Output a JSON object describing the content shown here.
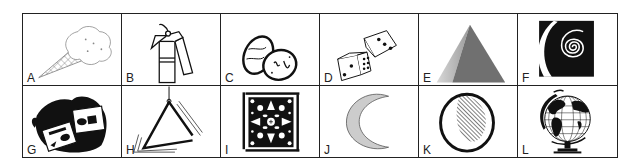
{
  "grid": {
    "rows": 2,
    "columns": 6,
    "cells": [
      {
        "label": "A",
        "icon": "ice-cream-cone-icon"
      },
      {
        "label": "B",
        "icon": "fire-extinguisher-icon"
      },
      {
        "label": "C",
        "icon": "easter-eggs-icon"
      },
      {
        "label": "D",
        "icon": "dice-icon"
      },
      {
        "label": "E",
        "icon": "pyramid-icon"
      },
      {
        "label": "F",
        "icon": "spiral-icon"
      },
      {
        "label": "G",
        "icon": "cassette-tapes-icon"
      },
      {
        "label": "H",
        "icon": "triangle-instrument-icon"
      },
      {
        "label": "I",
        "icon": "ornamental-tile-icon"
      },
      {
        "label": "J",
        "icon": "crescent-moon-icon"
      },
      {
        "label": "K",
        "icon": "moon-phase-icon"
      },
      {
        "label": "L",
        "icon": "globe-icon"
      }
    ]
  },
  "colors": {
    "border": "#222222",
    "ink": "#111111",
    "moon_fill": "#cccccc",
    "pyramid_dark": "#707070",
    "pyramid_light": "#b8b8b8"
  }
}
